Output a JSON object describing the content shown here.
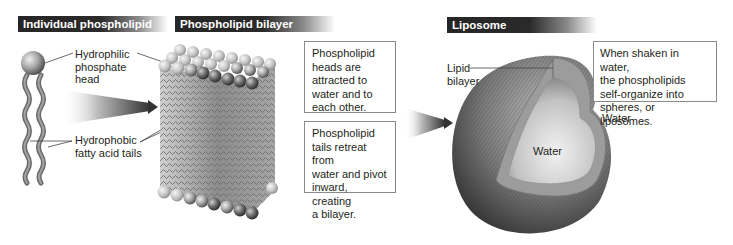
{
  "panels": {
    "individual": {
      "header": "Individual phospholipid",
      "labels": {
        "head": [
          "Hydrophilic",
          "phosphate",
          "head"
        ],
        "tails": [
          "Hydrophobic",
          "fatty acid tails"
        ]
      }
    },
    "bilayer": {
      "header": "Phospholipid bilayer",
      "notes": [
        [
          "Phospholipid",
          "heads are",
          "attracted to",
          "water and to",
          "each other."
        ],
        [
          "Phospholipid",
          "tails retreat from",
          "water and pivot",
          "inward, creating",
          "a bilayer."
        ]
      ]
    },
    "liposome": {
      "header": "Liposome",
      "labels": {
        "lipid_bilayer": [
          "Lipid",
          "bilayer"
        ],
        "water_inside": "Water",
        "water_outside": "Water"
      },
      "note": [
        "When shaken in water,",
        "the phospholipids",
        "self-organize into",
        "spheres, or liposomes."
      ]
    }
  },
  "colors": {
    "header_bg": "#262626",
    "header_text": "#ffffff",
    "box_border": "#8a8a8a",
    "text": "#231f20"
  }
}
